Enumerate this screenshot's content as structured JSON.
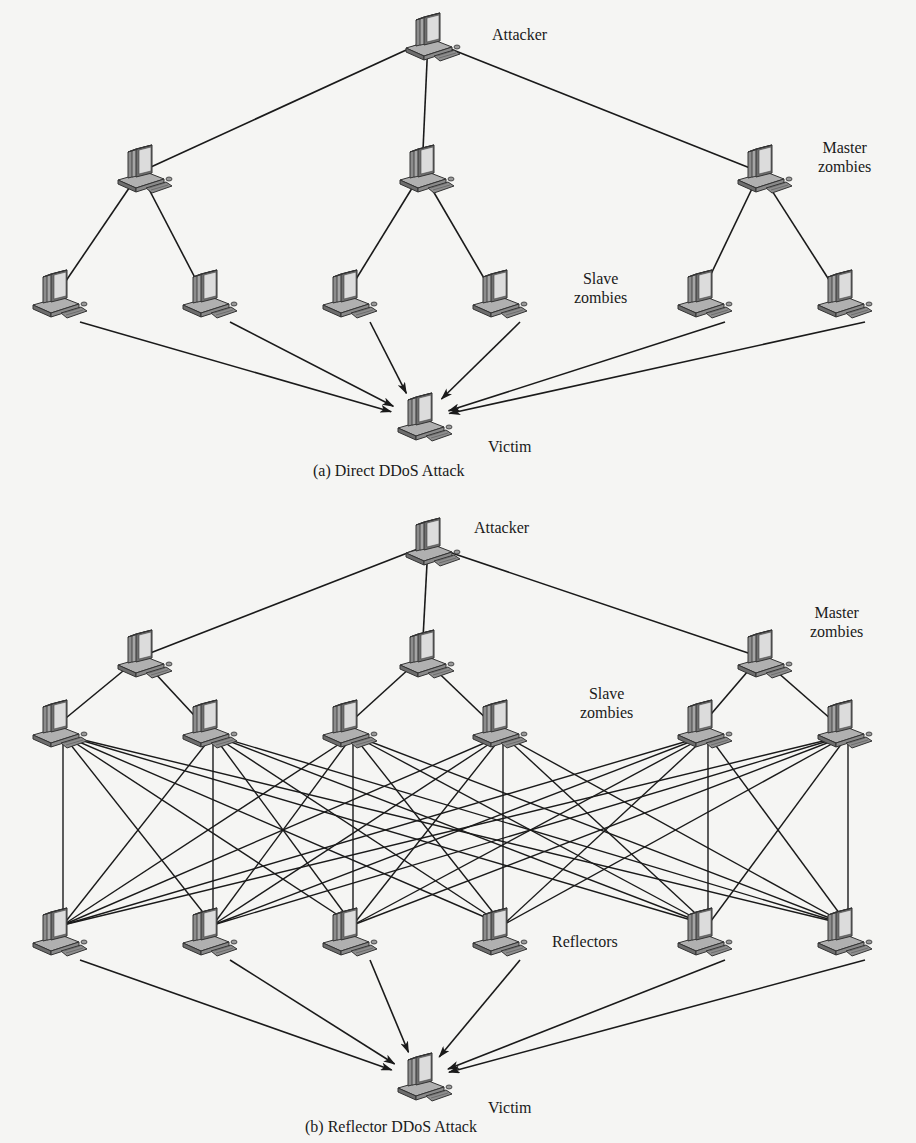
{
  "colors": {
    "background": "#f5f5f3",
    "line": "#1a1a1a",
    "monitor_body": "#9a9a9a",
    "monitor_screen": "#d8d8d8",
    "base": "#8a8a8a"
  },
  "diagrams": [
    {
      "id": "direct",
      "caption": "(a) Direct DDoS Attack",
      "caption_pos": [
        313,
        470
      ],
      "labels": [
        {
          "text": "Attacker",
          "pos": [
            492,
            35
          ],
          "anchor": "left"
        },
        {
          "text": "Master\nzombies",
          "pos": [
            820,
            148
          ],
          "anchor": "left"
        },
        {
          "text": "Slave\nzombies",
          "pos": [
            580,
            279
          ],
          "anchor": "left"
        },
        {
          "text": "Victim",
          "pos": [
            488,
            445
          ],
          "anchor": "left"
        }
      ],
      "nodes": {
        "attacker": [
          428,
          40
        ],
        "masters": [
          [
            140,
            172
          ],
          [
            422,
            172
          ],
          [
            760,
            172
          ]
        ],
        "slaves": [
          [
            55,
            297
          ],
          [
            205,
            297
          ],
          [
            345,
            297
          ],
          [
            495,
            297
          ],
          [
            700,
            297
          ],
          [
            840,
            297
          ]
        ],
        "victim": [
          420,
          420
        ]
      },
      "edges": {
        "attacker_to_masters": true,
        "master_to_slaves": [
          [
            0,
            [
              0,
              1
            ]
          ],
          [
            1,
            [
              2,
              3
            ]
          ],
          [
            2,
            [
              4,
              5
            ]
          ]
        ],
        "slaves_to_victim_arrows": true
      }
    },
    {
      "id": "reflector",
      "caption": "(b) Reflector DDoS Attack",
      "caption_pos": [
        305,
        1118
      ],
      "labels": [
        {
          "text": "Attacker",
          "pos": [
            474,
            528
          ],
          "anchor": "left"
        },
        {
          "text": "Master\nzombies",
          "pos": [
            812,
            613
          ],
          "anchor": "left"
        },
        {
          "text": "Slave\nzombies",
          "pos": [
            583,
            694
          ],
          "anchor": "left"
        },
        {
          "text": "Reflectors",
          "pos": [
            550,
            940
          ],
          "anchor": "left"
        },
        {
          "text": "Victim",
          "pos": [
            488,
            1105
          ],
          "anchor": "left"
        }
      ],
      "nodes": {
        "attacker": [
          428,
          545
        ],
        "masters": [
          [
            140,
            657
          ],
          [
            422,
            657
          ],
          [
            760,
            657
          ]
        ],
        "slaves": [
          [
            55,
            727
          ],
          [
            205,
            727
          ],
          [
            345,
            727
          ],
          [
            495,
            727
          ],
          [
            700,
            727
          ],
          [
            840,
            727
          ]
        ],
        "reflectors": [
          [
            55,
            935
          ],
          [
            205,
            935
          ],
          [
            345,
            935
          ],
          [
            495,
            935
          ],
          [
            700,
            935
          ],
          [
            840,
            935
          ]
        ],
        "victim": [
          420,
          1080
        ]
      },
      "edges": {
        "attacker_to_masters": true,
        "master_to_slaves": [
          [
            0,
            [
              0,
              1
            ]
          ],
          [
            1,
            [
              2,
              3
            ]
          ],
          [
            2,
            [
              4,
              5
            ]
          ]
        ],
        "slaves_to_reflectors_full_mesh": true,
        "reflectors_to_victim_arrows": true
      }
    }
  ]
}
